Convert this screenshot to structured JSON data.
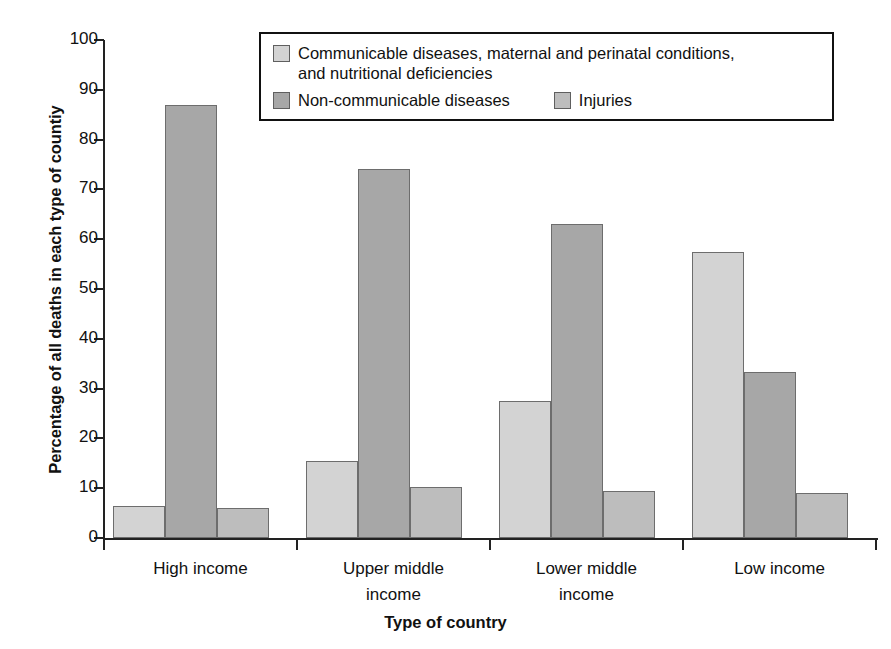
{
  "chart_data": {
    "type": "bar",
    "title": "",
    "xlabel": "Type of country",
    "ylabel": "Percentage of all deaths in each type of countiy",
    "ylim": [
      0,
      100
    ],
    "ytick_labels": [
      "100",
      "90",
      "80",
      "70",
      "60",
      "50",
      "40",
      "30",
      "20",
      "10",
      "0"
    ],
    "ytick_values": [
      100,
      90,
      80,
      70,
      60,
      50,
      40,
      30,
      20,
      10,
      0
    ],
    "grid": false,
    "legend_position": "top-center",
    "categories": [
      "High income",
      "Upper middle income",
      "Lower middle income",
      "Low income"
    ],
    "category_lines": [
      [
        "High income"
      ],
      [
        "Upper middle",
        "income"
      ],
      [
        "Lower middle",
        "income"
      ],
      [
        "Low income"
      ]
    ],
    "series": [
      {
        "name": "Communicable diseases, maternal and perinatal conditions, and nutritional deficiencies",
        "color": "#d3d3d3",
        "values": [
          6.5,
          15.5,
          27.5,
          57.5
        ]
      },
      {
        "name": "Non-communicable diseases",
        "color": "#a7a7a7",
        "values": [
          87.0,
          74.0,
          63.0,
          33.3
        ]
      },
      {
        "name": "Injuries",
        "color": "#bdbdbd",
        "values": [
          6.0,
          10.3,
          9.4,
          9.1
        ]
      }
    ]
  },
  "legend": {
    "entries": [
      {
        "label_line1": "Communicable diseases, maternal and perinatal conditions,",
        "label_line2": "and nutritional deficiencies"
      },
      {
        "label": "Non-communicable diseases"
      },
      {
        "label": "Injuries"
      }
    ]
  },
  "axes": {
    "y_title": "Percentage of all deaths in each type of countiy",
    "x_title": "Type of country"
  }
}
